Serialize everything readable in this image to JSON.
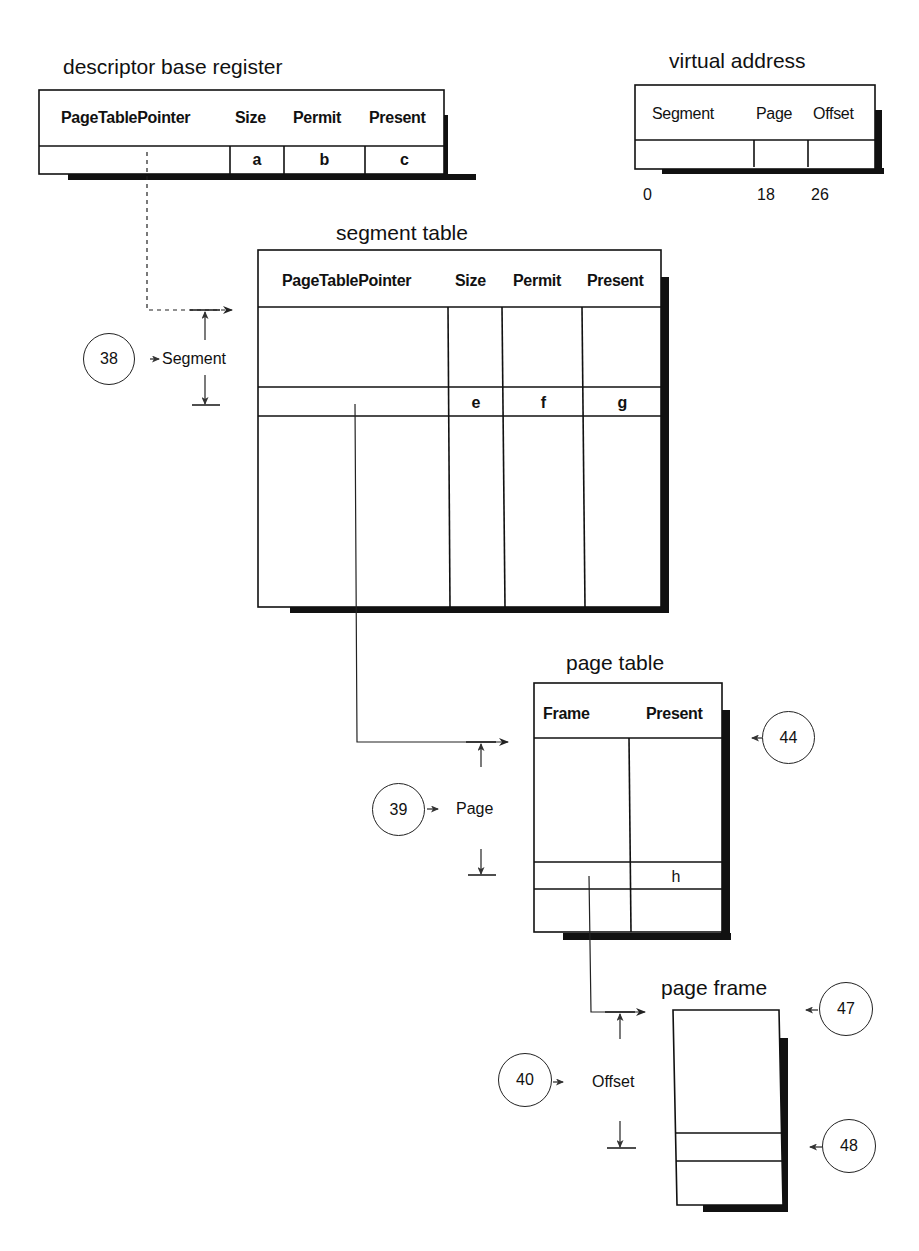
{
  "descriptor_base_register": {
    "title": "descriptor base register",
    "headers": [
      "PageTablePointer",
      "Size",
      "Permit",
      "Present"
    ],
    "cells": [
      "",
      "a",
      "b",
      "c"
    ]
  },
  "virtual_address": {
    "title": "virtual address",
    "headers": [
      "Segment",
      "Page",
      "Offset"
    ],
    "bit_positions": [
      "0",
      "18",
      "26"
    ]
  },
  "segment_table": {
    "title": "segment table",
    "headers": [
      "PageTablePointer",
      "Size",
      "Permit",
      "Present"
    ],
    "selected_row": [
      "",
      "e",
      "f",
      "g"
    ]
  },
  "page_table": {
    "title": "page table",
    "headers": [
      "Frame",
      "Present"
    ],
    "selected_row": [
      "",
      "h"
    ]
  },
  "page_frame": {
    "title": "page frame"
  },
  "index_labels": {
    "segment": "Segment",
    "page": "Page",
    "offset": "Offset"
  },
  "callouts": {
    "c38": "38",
    "c39": "39",
    "c40": "40",
    "c44": "44",
    "c47": "47",
    "c48": "48"
  }
}
